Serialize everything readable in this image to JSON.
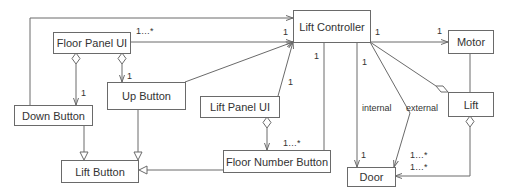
{
  "classes": {
    "floor_panel_ui": "Floor Panel UI",
    "lift_controller": "Lift Controller",
    "motor": "Motor",
    "up_button": "Up Button",
    "down_button": "Down Button",
    "lift_panel_ui": "Lift Panel UI",
    "lift": "Lift",
    "lift_button": "Lift Button",
    "floor_number_button": "Floor Number Button",
    "door": "Door"
  },
  "multiplicities": {
    "fpui_lc_src": "1…*",
    "fpui_lc_dst": "1",
    "fpui_down": "1",
    "fpui_up": "1",
    "lc_motor_src": "1",
    "lc_motor_dst": "1",
    "lc_fnb": "1",
    "lc_lpui": "1",
    "lc_door_internal": "1",
    "lpui_fnb": "1…*",
    "door_internal": "1",
    "door_external": "1…*",
    "door_lift": "1…*"
  },
  "roles": {
    "internal": "internal",
    "external": "external"
  },
  "colors": {
    "line": "#6a6a6a",
    "text": "#333333",
    "background": "#ffffff"
  }
}
